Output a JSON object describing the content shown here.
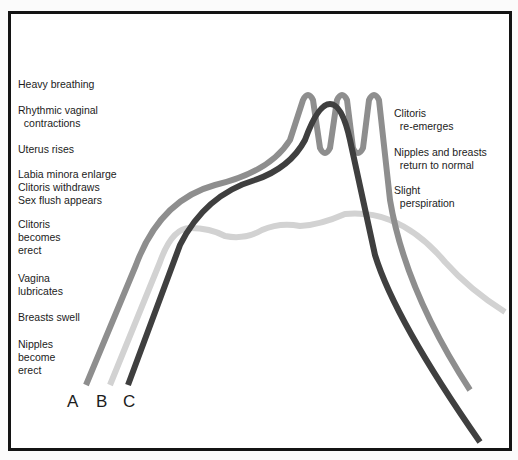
{
  "diagram": {
    "type": "response-curves",
    "left_labels": [
      {
        "text": "Heavy breathing",
        "top": 78
      },
      {
        "text": "Rhythmic vaginal\n  contractions",
        "top": 104
      },
      {
        "text": "Uterus rises",
        "top": 143
      },
      {
        "text": "Labia minora enlarge\nClitoris withdraws\nSex flush appears",
        "top": 168
      },
      {
        "text": "Clitoris\nbecomes\nerect",
        "top": 218
      },
      {
        "text": "Vagina\nlubricates",
        "top": 272
      },
      {
        "text": "Breasts swell",
        "top": 311
      },
      {
        "text": "Nipples\nbecome\nerect",
        "top": 338
      }
    ],
    "right_labels": [
      {
        "text": "Clitoris\n  re-emerges",
        "top": 107
      },
      {
        "text": "Nipples and breasts\n  return to normal",
        "top": 146
      },
      {
        "text": "Slight\n  perspiration",
        "top": 184
      }
    ],
    "curve_labels": [
      "A",
      "B",
      "C"
    ],
    "colors": {
      "A": "#8e8e8e",
      "B": "#d2d2d2",
      "C": "#3f3f3f",
      "border": "#141414"
    }
  }
}
